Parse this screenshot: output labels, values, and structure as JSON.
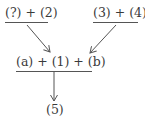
{
  "diagram": {
    "nodes": [
      {
        "id": "top-left",
        "label": "(?) + (2)"
      },
      {
        "id": "top-right",
        "label": "(3) + (4)"
      },
      {
        "id": "middle",
        "label": "(a) + (1) + (b)"
      },
      {
        "id": "bottom",
        "label": "(5)"
      }
    ],
    "edges": [
      {
        "from": "top-left",
        "to": "middle"
      },
      {
        "from": "top-right",
        "to": "middle"
      },
      {
        "from": "middle",
        "to": "bottom"
      }
    ],
    "colors": {
      "text": "#3a3a3a",
      "line": "#555555",
      "background": "#ffffff"
    }
  }
}
